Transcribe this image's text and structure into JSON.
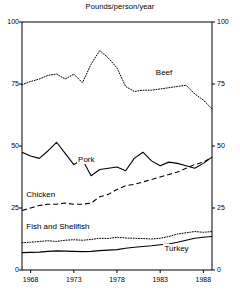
{
  "chart_data": {
    "type": "line",
    "title": "Pounds/person/year",
    "xlabel": "",
    "ylabel": "",
    "xlim": [
      1967,
      1989
    ],
    "ylim": [
      0,
      100
    ],
    "grid": false,
    "legend_position": "inline-labels",
    "x_ticks": [
      "1968",
      "1973",
      "1978",
      "1983",
      "1988"
    ],
    "x_tick_values": [
      1968,
      1973,
      1978,
      1983,
      1988
    ],
    "y_ticks_left": [
      "0",
      "25",
      "50",
      "75",
      "100"
    ],
    "y_ticks_right": [
      "0",
      "25",
      "50",
      "75",
      "100"
    ],
    "y_tick_values": [
      0,
      25,
      50,
      75,
      100
    ],
    "x": [
      1967,
      1968,
      1969,
      1970,
      1971,
      1972,
      1973,
      1974,
      1975,
      1976,
      1977,
      1978,
      1979,
      1980,
      1981,
      1982,
      1983,
      1984,
      1985,
      1986,
      1987,
      1988,
      1989
    ],
    "series": [
      {
        "name": "Beef",
        "style": "dotted",
        "label_x": 1984,
        "label_y": 79,
        "values": [
          74.7,
          76.0,
          77.0,
          78.5,
          79.0,
          77.0,
          79.0,
          75.5,
          83.0,
          88.5,
          85.5,
          81.5,
          74.0,
          72.0,
          72.5,
          72.5,
          73.0,
          73.5,
          74.0,
          74.5,
          71.0,
          68.5,
          65.0
        ]
      },
      {
        "name": "Pork",
        "style": "solid",
        "label_x": 1975,
        "label_y": 44,
        "values": [
          47.5,
          46.0,
          45.0,
          48.0,
          51.5,
          47.0,
          42.5,
          44.5,
          38.0,
          40.5,
          41.0,
          41.5,
          40.0,
          45.0,
          47.5,
          44.0,
          42.0,
          43.5,
          43.0,
          42.0,
          41.0,
          43.0,
          45.5
        ]
      },
      {
        "name": "Chicken",
        "style": "dashed",
        "label_x": 1969,
        "label_y": 30,
        "values": [
          24.0,
          25.0,
          26.0,
          26.5,
          26.5,
          27.0,
          26.5,
          26.5,
          27.0,
          29.5,
          30.5,
          32.5,
          34.0,
          34.5,
          35.5,
          36.5,
          37.5,
          38.5,
          39.5,
          41.0,
          42.5,
          43.5,
          45.5
        ]
      },
      {
        "name": "Fish and Shellfish",
        "style": "dotted",
        "label_x": 1969,
        "label_y": 17,
        "values": [
          11.0,
          11.2,
          11.5,
          11.8,
          11.5,
          12.0,
          12.2,
          12.0,
          12.3,
          12.8,
          12.7,
          13.2,
          12.9,
          12.8,
          12.7,
          12.5,
          12.8,
          13.5,
          14.5,
          15.0,
          15.5,
          15.2,
          15.5
        ]
      },
      {
        "name": "Turkey",
        "style": "solid",
        "label_x": 1985,
        "label_y": 8,
        "values": [
          7.0,
          7.1,
          7.2,
          7.5,
          7.7,
          7.6,
          7.5,
          7.4,
          7.5,
          7.8,
          8.0,
          8.2,
          8.8,
          9.2,
          9.5,
          9.8,
          10.2,
          10.5,
          11.2,
          12.0,
          12.8,
          13.2,
          13.5
        ]
      }
    ]
  },
  "labels": {
    "title": "Pounds/person/year",
    "beef": "Beef",
    "pork": "Pork",
    "chicken": "Chicken",
    "fish": "Fish and Shellfish",
    "turkey": "Turkey"
  },
  "colors": {
    "line": "#000000",
    "axis": "#000000",
    "background": "#ffffff"
  }
}
